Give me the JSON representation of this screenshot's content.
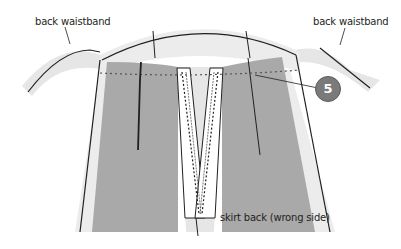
{
  "diagram": {
    "labels": {
      "waistband_left": "back waistband",
      "waistband_right": "back waistband",
      "skirt": "skirt back (wrong side)"
    },
    "step_number": "5",
    "colors": {
      "fabric_wrong_side": "#a9a9a9",
      "waistband": "#e8e8e8",
      "outline": "#231f20",
      "zipper_tape": "#ffffff",
      "step_badge": "#7a7a7a"
    }
  }
}
